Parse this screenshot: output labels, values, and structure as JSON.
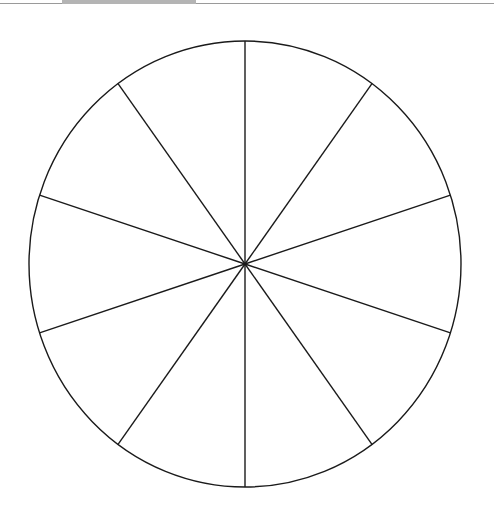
{
  "diagram": {
    "type": "segmented-circle",
    "segments": 10,
    "center": [
      245,
      264
    ],
    "radius_x": 216,
    "radius_y": 223,
    "stroke_color": "#1a1a1a",
    "stroke_width": 1.4,
    "start_angle_deg": -90
  },
  "header": {
    "bar_color": "#b4b4b4",
    "line_color": "#9a9a9a"
  }
}
